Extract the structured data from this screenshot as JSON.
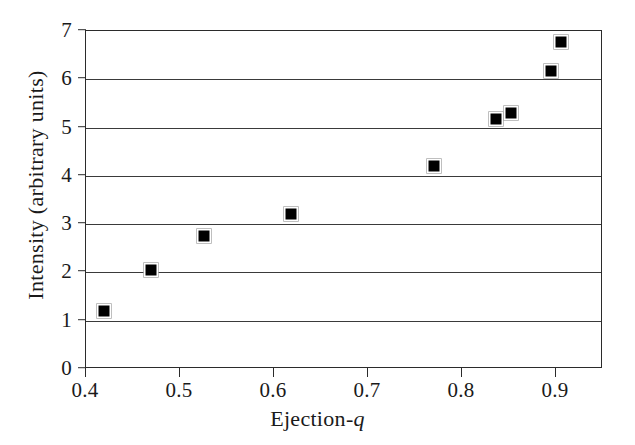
{
  "chart_data": {
    "type": "scatter",
    "title": "",
    "xlabel": "Ejection-q",
    "xlabel_plain": "Ejection-",
    "xlabel_italic": "q",
    "ylabel": "Intensity (arbitrary units)",
    "xlim": [
      0.4,
      0.95
    ],
    "ylim": [
      0,
      7
    ],
    "xticks": [
      0.4,
      0.5,
      0.6,
      0.7,
      0.8,
      0.9
    ],
    "xticklabels": [
      "0.4",
      "0.5",
      "0.6",
      "0.7",
      "0.8",
      "0.9"
    ],
    "yticks": [
      0,
      1,
      2,
      3,
      4,
      5,
      6,
      7
    ],
    "yticklabels": [
      "0",
      "1",
      "2",
      "3",
      "4",
      "5",
      "6",
      "7"
    ],
    "gridlines_y": [
      1,
      2,
      3,
      4,
      5,
      6
    ],
    "grid": "horizontal",
    "legend": "none",
    "marker": "filled-square",
    "marker_color": "#000000",
    "frame_color": "#2b2b2b",
    "background": "#ffffff",
    "x": [
      0.419,
      0.469,
      0.525,
      0.618,
      0.77,
      0.836,
      0.852,
      0.895,
      0.905
    ],
    "y": [
      1.2,
      2.05,
      2.76,
      3.2,
      4.2,
      5.18,
      5.3,
      6.18,
      6.78
    ],
    "points": [
      {
        "x": 0.419,
        "y": 1.2
      },
      {
        "x": 0.469,
        "y": 2.05
      },
      {
        "x": 0.525,
        "y": 2.76
      },
      {
        "x": 0.618,
        "y": 3.2
      },
      {
        "x": 0.77,
        "y": 4.2
      },
      {
        "x": 0.836,
        "y": 5.18
      },
      {
        "x": 0.852,
        "y": 5.3
      },
      {
        "x": 0.895,
        "y": 6.18
      },
      {
        "x": 0.905,
        "y": 6.78
      }
    ]
  }
}
